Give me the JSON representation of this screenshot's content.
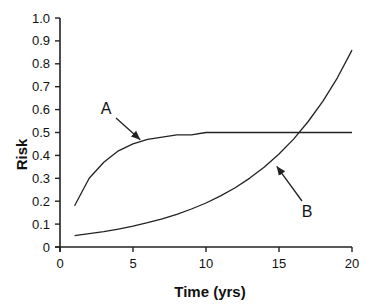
{
  "chart_data": {
    "type": "line",
    "title": "",
    "xlabel": "Time (yrs)",
    "ylabel": "Risk",
    "xlim": [
      0,
      20
    ],
    "ylim": [
      0,
      1.0
    ],
    "xticks": [
      "0",
      "5",
      "10",
      "15",
      "20"
    ],
    "yticks": [
      "0",
      "0.1",
      "0.2",
      "0.3",
      "0.4",
      "0.5",
      "0.6",
      "0.7",
      "0.8",
      "0.9",
      "1.0"
    ],
    "grid": false,
    "legend": null,
    "x": [
      1,
      2,
      3,
      4,
      5,
      6,
      7,
      8,
      9,
      10,
      11,
      12,
      13,
      14,
      15,
      16,
      17,
      18,
      19,
      20
    ],
    "series": [
      {
        "name": "A",
        "values": [
          0.18,
          0.3,
          0.37,
          0.42,
          0.45,
          0.47,
          0.48,
          0.49,
          0.49,
          0.5,
          0.5,
          0.5,
          0.5,
          0.5,
          0.5,
          0.5,
          0.5,
          0.5,
          0.5,
          0.5
        ]
      },
      {
        "name": "B",
        "values": [
          0.05,
          0.058,
          0.067,
          0.078,
          0.091,
          0.106,
          0.123,
          0.143,
          0.166,
          0.192,
          0.223,
          0.259,
          0.301,
          0.35,
          0.406,
          0.471,
          0.548,
          0.636,
          0.739,
          0.86
        ]
      }
    ],
    "annotations": [
      {
        "text": "A",
        "points_to": [
          5.5,
          0.46
        ]
      },
      {
        "text": "B",
        "points_to": [
          14.5,
          0.37
        ]
      }
    ]
  }
}
